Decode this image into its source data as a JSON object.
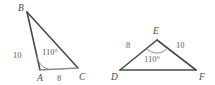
{
  "figure": {
    "kind": "geometry-diagram",
    "background_color": "#ffffff",
    "line_color": "#4a4a4a",
    "text_color": "#5a5a5a"
  },
  "triangles": [
    {
      "id": "ABC",
      "name": "left-triangle",
      "vertices": [
        {
          "label": "B",
          "x": 27,
          "y": 12,
          "label_x": 18,
          "label_y": 11
        },
        {
          "label": "A",
          "x": 40,
          "y": 70,
          "label_x": 37,
          "label_y": 81
        },
        {
          "label": "C",
          "x": 78,
          "y": 68,
          "label_x": 79,
          "label_y": 80
        }
      ],
      "sides": [
        {
          "from": "A",
          "to": "B",
          "length": "10",
          "label_x": 13,
          "label_y": 58
        },
        {
          "from": "A",
          "to": "C",
          "length": "8",
          "label_x": 57,
          "label_y": 81
        }
      ],
      "angle": {
        "at": "A",
        "value": "110°",
        "label_x": 42,
        "label_y": 55
      }
    },
    {
      "id": "DEF",
      "name": "right-triangle",
      "vertices": [
        {
          "label": "E",
          "x": 157,
          "y": 40,
          "label_x": 153,
          "label_y": 34
        },
        {
          "label": "D",
          "x": 120,
          "y": 70,
          "label_x": 111,
          "label_y": 80
        },
        {
          "label": "F",
          "x": 196,
          "y": 70,
          "label_x": 199,
          "label_y": 80
        }
      ],
      "sides": [
        {
          "from": "D",
          "to": "E",
          "length": "8",
          "label_x": 126,
          "label_y": 48
        },
        {
          "from": "E",
          "to": "F",
          "length": "10",
          "label_x": 176,
          "label_y": 48
        }
      ],
      "angle": {
        "at": "E",
        "value": "110°",
        "label_x": 144,
        "label_y": 62
      }
    }
  ]
}
